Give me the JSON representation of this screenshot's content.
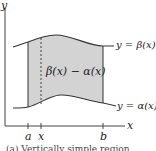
{
  "diagram": {
    "axis_labels": {
      "x": "x",
      "y": "y"
    },
    "tick_labels": {
      "a": "a",
      "x": "x",
      "b": "b"
    },
    "curves": {
      "upper": {
        "label": "y = β(x)"
      },
      "lower": {
        "label": "y = α(x)"
      }
    },
    "region_label": "β(x) − α(x)",
    "caption": "(a) Vertically simple region",
    "colors": {
      "fill": "#d3d3d3",
      "stroke": "#333333"
    }
  }
}
